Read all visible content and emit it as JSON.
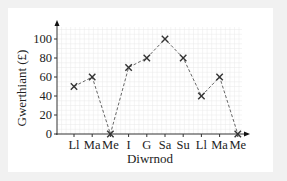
{
  "chart_data": {
    "type": "line",
    "title": "",
    "xlabel": "Diwrnod",
    "ylabel": "Gwerthiant (£)",
    "categories": [
      "Ll",
      "Ma",
      "Me",
      "I",
      "G",
      "Sa",
      "Su",
      "Ll",
      "Ma",
      "Me"
    ],
    "values": [
      50,
      60,
      0,
      70,
      80,
      100,
      80,
      40,
      60,
      0
    ],
    "series": [
      {
        "name": "Gwerthiant",
        "values": [
          50,
          60,
          0,
          70,
          80,
          100,
          80,
          40,
          60,
          0
        ],
        "marker": "x",
        "line_style": "dashed"
      }
    ],
    "ylim": [
      0,
      110
    ],
    "yticks": [
      0,
      20,
      40,
      60,
      80,
      100
    ],
    "grid": true,
    "legend": null
  },
  "colors": {
    "background": "#f1f1f1",
    "panel": "#ffffff",
    "grid": "#e8e8e8",
    "axis": "#333333",
    "line": "#666666",
    "marker": "#333333"
  }
}
